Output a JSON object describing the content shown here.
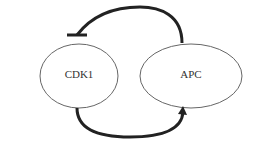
{
  "nodes": [
    {
      "id": "cdk1",
      "label": "CDK1"
    },
    {
      "id": "apc",
      "label": "APC"
    }
  ],
  "edges": [
    {
      "from": "apc",
      "to": "cdk1",
      "type": "inhibition"
    },
    {
      "from": "cdk1",
      "to": "apc",
      "type": "activation"
    }
  ],
  "colors": {
    "stroke": "#222222",
    "ellipse": "#555555"
  }
}
